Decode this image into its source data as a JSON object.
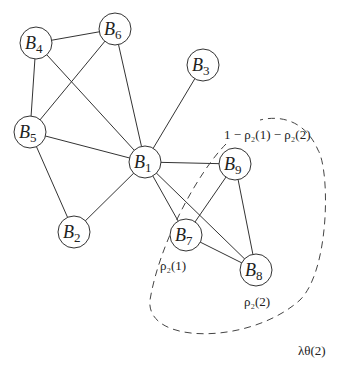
{
  "diagram": {
    "nodes": [
      {
        "id": "B1",
        "name": "B",
        "sub": "1",
        "x": 145,
        "y": 162
      },
      {
        "id": "B2",
        "name": "B",
        "sub": "2",
        "x": 74,
        "y": 232
      },
      {
        "id": "B3",
        "name": "B",
        "sub": "3",
        "x": 203,
        "y": 65
      },
      {
        "id": "B4",
        "name": "B",
        "sub": "4",
        "x": 36,
        "y": 43
      },
      {
        "id": "B5",
        "name": "B",
        "sub": "5",
        "x": 30,
        "y": 132
      },
      {
        "id": "B6",
        "name": "B",
        "sub": "6",
        "x": 115,
        "y": 29
      },
      {
        "id": "B7",
        "name": "B",
        "sub": "7",
        "x": 186,
        "y": 235
      },
      {
        "id": "B8",
        "name": "B",
        "sub": "8",
        "x": 256,
        "y": 270
      },
      {
        "id": "B9",
        "name": "B",
        "sub": "9",
        "x": 235,
        "y": 164
      }
    ],
    "edges": [
      [
        "B4",
        "B6"
      ],
      [
        "B4",
        "B5"
      ],
      [
        "B4",
        "B1"
      ],
      [
        "B6",
        "B5"
      ],
      [
        "B6",
        "B1"
      ],
      [
        "B5",
        "B1"
      ],
      [
        "B5",
        "B2"
      ],
      [
        "B2",
        "B1"
      ],
      [
        "B3",
        "B1"
      ],
      [
        "B1",
        "B9"
      ],
      [
        "B1",
        "B7"
      ],
      [
        "B1",
        "B8"
      ],
      [
        "B9",
        "B7"
      ],
      [
        "B9",
        "B8"
      ],
      [
        "B7",
        "B8"
      ]
    ],
    "labels": {
      "top_prob": "1 − ρ₂(1) − ρ₂(2)",
      "rho_1": "ρ₂(1)",
      "rho_2": "ρ₂(2)",
      "lambda": "λθ(2)"
    }
  }
}
